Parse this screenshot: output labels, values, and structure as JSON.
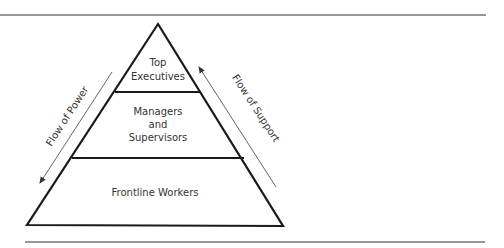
{
  "diagram": {
    "type": "hierarchy-pyramid",
    "levels": [
      {
        "line1": "Top",
        "line2": "Executives"
      },
      {
        "line1": "Managers",
        "line2": "and",
        "line3": "Supervisors"
      },
      {
        "line1": "Frontline Workers"
      }
    ],
    "arrows": {
      "left": "Flow of Power",
      "right": "Flow of Support"
    },
    "colors": {
      "stroke": "#1a1a1a",
      "text": "#333333",
      "background": "#ffffff"
    }
  }
}
